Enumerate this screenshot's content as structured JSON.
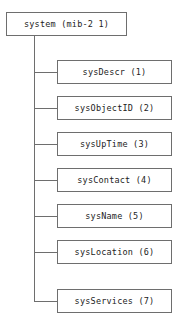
{
  "diagram": {
    "type": "tree",
    "colors": {
      "background": "#ffffff",
      "border": "#6e6e6e",
      "connector": "#6e6e6e",
      "text": "#1c1c1c"
    },
    "root": {
      "label": "system (mib-2 1)",
      "name": "system",
      "oid_suffix": "mib-2 1"
    },
    "children": [
      {
        "label": "sysDescr (1)",
        "name": "sysDescr",
        "oid_suffix": "1"
      },
      {
        "label": "sysObjectID (2)",
        "name": "sysObjectID",
        "oid_suffix": "2"
      },
      {
        "label": "sysUpTime (3)",
        "name": "sysUpTime",
        "oid_suffix": "3"
      },
      {
        "label": "sysContact (4)",
        "name": "sysContact",
        "oid_suffix": "4"
      },
      {
        "label": "sysName (5)",
        "name": "sysName",
        "oid_suffix": "5"
      },
      {
        "label": "sysLocation (6)",
        "name": "sysLocation",
        "oid_suffix": "6"
      },
      {
        "label": "sysServices (7)",
        "name": "sysServices",
        "oid_suffix": "7"
      }
    ]
  }
}
